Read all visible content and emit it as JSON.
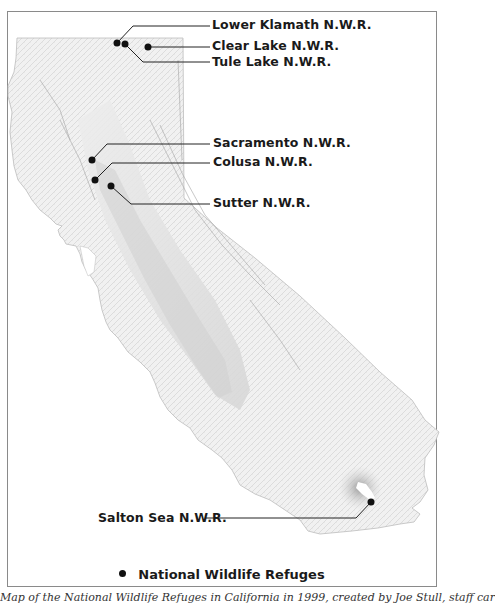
{
  "map": {
    "region": "California",
    "refuges": [
      {
        "name": "Lower Klamath N.W.R.",
        "dot": [
          117,
          43
        ],
        "label_pos": [
          212,
          17
        ]
      },
      {
        "name": "Clear Lake N.W.R.",
        "dot": [
          148,
          47
        ],
        "label_pos": [
          212,
          40
        ]
      },
      {
        "name": "Tule Lake N.W.R.",
        "dot": [
          125,
          44
        ],
        "label_pos": [
          212,
          56
        ]
      },
      {
        "name": "Sacramento N.W.R.",
        "dot": [
          92,
          160
        ],
        "label_pos": [
          213,
          136
        ]
      },
      {
        "name": "Colusa N.W.R.",
        "dot": [
          95,
          180
        ],
        "label_pos": [
          213,
          155
        ]
      },
      {
        "name": "Sutter N.W.R.",
        "dot": [
          111,
          186
        ],
        "label_pos": [
          213,
          196
        ]
      },
      {
        "name": "Salton Sea N.W.R.",
        "dot": [
          371,
          502
        ],
        "label_pos": [
          98,
          512
        ]
      }
    ]
  },
  "legend": {
    "symbol": "filled-black-dot",
    "label": "National Wildlife Refuges"
  },
  "caption": "Map of the National Wildlife Refuges in California in 1999, created by Joe Stull, staff car"
}
